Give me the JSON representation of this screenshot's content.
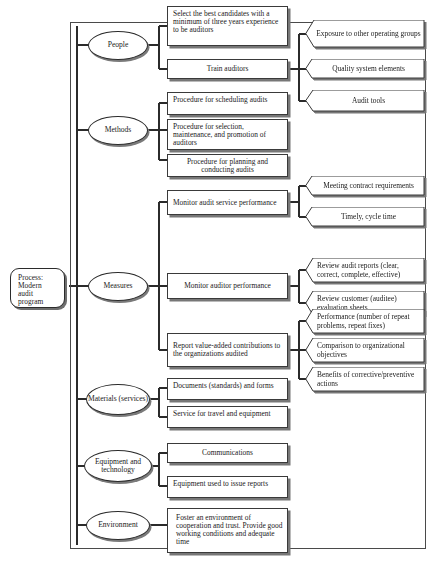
{
  "diagram": {
    "type": "tree-diagram",
    "orientation": "left-to-right",
    "root": {
      "label": "Process: Modern audit program"
    },
    "branches": [
      {
        "name": "people",
        "label": "People",
        "children": [
          {
            "name": "select-best-candidates",
            "label": "Select the best candidates with a minimum of three years experience to be auditors",
            "children": []
          },
          {
            "name": "train-auditors",
            "label": "Train auditors",
            "children": [
              {
                "name": "exposure-other-groups",
                "label": "Exposure to other operating groups"
              },
              {
                "name": "quality-system-elements",
                "label": "Quality system elements"
              },
              {
                "name": "audit-tools",
                "label": "Audit tools"
              }
            ]
          }
        ]
      },
      {
        "name": "methods",
        "label": "Methods",
        "children": [
          {
            "name": "procedure-scheduling-audits",
            "label": "Procedure for scheduling audits",
            "children": []
          },
          {
            "name": "procedure-selection-maintenance",
            "label": "Procedure for selection, maintenance, and promotion of auditors",
            "children": []
          },
          {
            "name": "procedure-planning-conducting",
            "label": "Procedure for planning and conducting audits",
            "children": []
          }
        ]
      },
      {
        "name": "measures",
        "label": "Measures",
        "children": [
          {
            "name": "monitor-audit-service-performance",
            "label": "Monitor audit service performance",
            "children": [
              {
                "name": "meeting-contract-requirements",
                "label": "Meeting contract requirements"
              },
              {
                "name": "timely-cycle-time",
                "label": "Timely, cycle time"
              }
            ]
          },
          {
            "name": "monitor-auditor-performance",
            "label": "Monitor auditor performance",
            "children": [
              {
                "name": "review-audit-reports",
                "label": "Review audit reports (clear, correct, complete, effective)"
              },
              {
                "name": "review-customer-evaluation-sheets",
                "label": "Review customer (auditee) evaluation sheets"
              }
            ]
          },
          {
            "name": "report-value-added-contributions",
            "label": "Report value-added contributions to the organizations audited",
            "children": [
              {
                "name": "performance-repeat-problems",
                "label": "Performance (number of repeat problems, repeat fixes)"
              },
              {
                "name": "comparison-organizational-objectives",
                "label": "Comparison to organizational objectives"
              },
              {
                "name": "benefits-corrective-preventive",
                "label": "Benefits of corrective/preventive actions"
              }
            ]
          }
        ]
      },
      {
        "name": "materials-services",
        "label": "Materials (services)",
        "children": [
          {
            "name": "documents-standards-forms",
            "label": "Documents (standards) and forms",
            "children": []
          },
          {
            "name": "service-travel-equipment",
            "label": "Service for travel and equipment",
            "children": []
          }
        ]
      },
      {
        "name": "equipment-technology",
        "label": "Equipment and technology",
        "children": [
          {
            "name": "communications",
            "label": "Communications",
            "children": []
          },
          {
            "name": "equipment-issue-reports",
            "label": "Equipment used to issue reports",
            "children": []
          }
        ]
      },
      {
        "name": "environment",
        "label": "Environment",
        "children": [
          {
            "name": "foster-environment",
            "label": "Foster an environment of cooperation and trust. Provide good working conditions and adequate time",
            "children": []
          }
        ]
      }
    ]
  },
  "caption": {
    "text": ""
  },
  "colors": {
    "line": "#2b2b2b",
    "shadow": "#777777",
    "box_border": "#3a3a3a",
    "background": "#ffffff",
    "text": "#1a1a1a"
  }
}
